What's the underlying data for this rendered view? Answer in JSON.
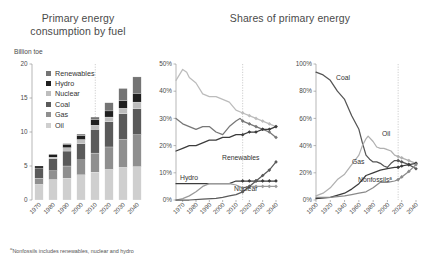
{
  "titles": {
    "left": "Primary energy consumption by fuel",
    "right": "Shares of primary energy"
  },
  "left_units": "Billion toe",
  "footnote_marker": "a",
  "footnote": "Nonfossils includes renewables, nuclear and hydro",
  "colors": {
    "oil": "#cfcfcf",
    "gas": "#8f8f8f",
    "coal": "#5a5a5a",
    "nuclear": "#bdbdbd",
    "hydro": "#1f1f1f",
    "renewables": "#747474",
    "axis": "#9a9a9a",
    "divider": "#b9b9b9",
    "line_dark": "#3c3c3c",
    "line_mid": "#777777",
    "line_light": "#bcbcbc"
  },
  "legend": [
    {
      "label": "Renewables",
      "color": "#747474"
    },
    {
      "label": "Hydro",
      "color": "#1f1f1f"
    },
    {
      "label": "Nuclear",
      "color": "#bdbdbd"
    },
    {
      "label": "Coal",
      "color": "#5a5a5a"
    },
    {
      "label": "Gas",
      "color": "#8f8f8f"
    },
    {
      "label": "Oil",
      "color": "#cfcfcf"
    }
  ],
  "chart_data": [
    {
      "type": "bar",
      "title": "Primary energy consumption by fuel",
      "ylabel": "Billion toe",
      "xlabel": "",
      "ylim": [
        0,
        20
      ],
      "yticks": [
        0,
        5,
        10,
        15,
        20
      ],
      "ytick_labels": [
        "0",
        "5",
        "10",
        "15",
        "20"
      ],
      "grid": false,
      "stacked": true,
      "legend_position": "inside-top-left",
      "forecast_start": "2015",
      "categories": [
        "1970",
        "1980",
        "1990",
        "2000",
        "2010",
        "2020",
        "2030",
        "2040"
      ],
      "series": [
        {
          "name": "Oil",
          "values": [
            2.3,
            3.0,
            3.2,
            3.7,
            4.1,
            4.5,
            4.8,
            4.9
          ]
        },
        {
          "name": "Gas",
          "values": [
            0.9,
            1.3,
            1.8,
            2.2,
            2.8,
            3.3,
            4.1,
            4.7
          ]
        },
        {
          "name": "Coal",
          "values": [
            1.5,
            1.8,
            2.2,
            2.4,
            3.5,
            3.7,
            3.8,
            3.8
          ]
        },
        {
          "name": "Nuclear",
          "values": [
            0.0,
            0.2,
            0.5,
            0.6,
            0.6,
            0.7,
            0.8,
            1.0
          ]
        },
        {
          "name": "Hydro",
          "values": [
            0.3,
            0.4,
            0.5,
            0.6,
            0.8,
            0.9,
            1.1,
            1.3
          ]
        },
        {
          "name": "Renewables",
          "values": [
            0.0,
            0.0,
            0.1,
            0.2,
            0.4,
            1.2,
            1.8,
            2.4
          ]
        }
      ]
    },
    {
      "type": "line",
      "title": "Shares of primary energy",
      "ylim": [
        0,
        50
      ],
      "yticks": [
        0,
        10,
        20,
        30,
        40,
        50
      ],
      "ytick_labels": [
        "0%",
        "10%",
        "20%",
        "30%",
        "40%",
        "50%"
      ],
      "xlim": [
        1965,
        2040
      ],
      "xticks": [
        1970,
        1980,
        1990,
        2000,
        2010,
        2020,
        2030,
        2040
      ],
      "xtick_labels": [
        "1970",
        "1980",
        "1990",
        "2000",
        "2010",
        "2020",
        "2030",
        "2040"
      ],
      "grid": false,
      "forecast_start": 2015,
      "annotations": [
        "Renewables",
        "Hydro",
        "Nuclear"
      ],
      "series": [
        {
          "name": "Oil",
          "color": "#bcbcbc",
          "x": [
            1965,
            1970,
            1973,
            1975,
            1980,
            1985,
            1990,
            1995,
            2000,
            2005,
            2010,
            2015,
            2020,
            2025,
            2030,
            2035,
            2040
          ],
          "values": [
            44,
            48,
            47,
            45,
            43,
            39,
            38,
            38,
            37,
            36,
            33,
            32,
            31,
            30,
            29,
            28,
            27
          ]
        },
        {
          "name": "Coal",
          "color": "#777777",
          "x": [
            1965,
            1970,
            1975,
            1980,
            1985,
            1990,
            1995,
            2000,
            2005,
            2010,
            2013,
            2015,
            2020,
            2025,
            2030,
            2035,
            2040
          ],
          "values": [
            30,
            28,
            27,
            26,
            27,
            27,
            25,
            24,
            27,
            29,
            30,
            29,
            28,
            27,
            26,
            25,
            23
          ]
        },
        {
          "name": "Gas",
          "color": "#3c3c3c",
          "x": [
            1965,
            1970,
            1975,
            1980,
            1985,
            1990,
            1995,
            2000,
            2005,
            2010,
            2015,
            2020,
            2025,
            2030,
            2035,
            2040
          ],
          "values": [
            18,
            19,
            20,
            20,
            21,
            22,
            22,
            23,
            23,
            24,
            24,
            25,
            25,
            26,
            26,
            27
          ]
        },
        {
          "name": "Hydro",
          "color": "#3c3c3c",
          "x": [
            1965,
            1975,
            1985,
            1995,
            2005,
            2010,
            2015,
            2020,
            2025,
            2030,
            2035,
            2040
          ],
          "values": [
            6,
            6,
            6,
            6,
            6,
            7,
            7,
            7,
            7,
            7,
            7,
            7
          ]
        },
        {
          "name": "Nuclear",
          "color": "#9a9a9a",
          "x": [
            1965,
            1970,
            1975,
            1980,
            1985,
            1990,
            1995,
            2000,
            2005,
            2010,
            2015,
            2020,
            2025,
            2030,
            2035,
            2040
          ],
          "values": [
            0,
            0.5,
            1.5,
            3,
            5,
            6,
            6,
            6,
            6,
            5.5,
            4.5,
            5,
            5,
            5,
            5,
            5
          ]
        },
        {
          "name": "Renewables",
          "color": "#5a5a5a",
          "x": [
            1965,
            1975,
            1985,
            1995,
            2000,
            2005,
            2010,
            2015,
            2020,
            2025,
            2030,
            2035,
            2040
          ],
          "values": [
            0,
            0,
            0.3,
            0.6,
            1,
            1.5,
            2,
            3,
            5,
            7,
            9,
            11,
            14
          ]
        }
      ]
    },
    {
      "type": "line",
      "title": "Shares of primary energy",
      "ylim": [
        0,
        100
      ],
      "yticks": [
        0,
        20,
        40,
        60,
        80,
        100
      ],
      "ytick_labels": [
        "0%",
        "20%",
        "40%",
        "60%",
        "80%",
        "100%"
      ],
      "xlim": [
        1900,
        2040
      ],
      "xticks": [
        1900,
        1920,
        1940,
        1960,
        1980,
        2000,
        2020,
        2040
      ],
      "xtick_labels": [
        "1900",
        "1920",
        "1940",
        "1960",
        "1980",
        "2000",
        "2020",
        "2040"
      ],
      "grid": false,
      "forecast_start": 2015,
      "annotations": [
        "Coal",
        "Oil",
        "Gas",
        "Nonfossils"
      ],
      "series": [
        {
          "name": "Coal",
          "color": "#555555",
          "x": [
            1900,
            1910,
            1920,
            1930,
            1940,
            1950,
            1960,
            1965,
            1970,
            1975,
            1980,
            1985,
            1990,
            1995,
            2000,
            2005,
            2010,
            2015,
            2020,
            2030,
            2040
          ],
          "values": [
            94,
            92,
            88,
            80,
            74,
            62,
            52,
            42,
            33,
            30,
            28,
            28,
            27,
            25,
            24,
            27,
            29,
            29,
            28,
            26,
            23
          ]
        },
        {
          "name": "Oil",
          "color": "#b0b0b0",
          "x": [
            1900,
            1910,
            1920,
            1930,
            1940,
            1950,
            1960,
            1965,
            1970,
            1973,
            1980,
            1985,
            1990,
            1995,
            2000,
            2005,
            2010,
            2015,
            2020,
            2030,
            2040
          ],
          "values": [
            3,
            5,
            9,
            15,
            19,
            26,
            33,
            40,
            45,
            47,
            43,
            39,
            38,
            38,
            37,
            36,
            33,
            32,
            31,
            29,
            27
          ]
        },
        {
          "name": "Gas",
          "color": "#3c3c3c",
          "x": [
            1900,
            1920,
            1940,
            1950,
            1960,
            1970,
            1980,
            1990,
            2000,
            2010,
            2015,
            2020,
            2030,
            2040
          ],
          "values": [
            1,
            2,
            5,
            8,
            12,
            18,
            20,
            22,
            23,
            24,
            24,
            25,
            26,
            27
          ]
        },
        {
          "name": "Nonfossils",
          "color": "#8a8a8a",
          "x": [
            1900,
            1920,
            1940,
            1950,
            1960,
            1970,
            1980,
            1990,
            2000,
            2010,
            2015,
            2020,
            2030,
            2040
          ],
          "values": [
            2,
            2,
            3,
            4,
            5,
            6,
            9,
            13,
            13,
            14,
            15,
            17,
            21,
            26
          ]
        }
      ]
    }
  ]
}
